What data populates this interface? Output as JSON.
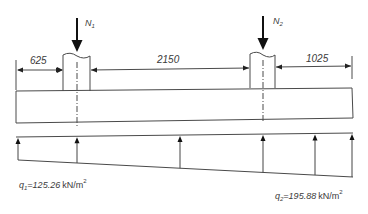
{
  "diagram": {
    "type": "foundation-beam-load-diagram",
    "column_loads": [
      {
        "symbol": "N",
        "subscript": "1"
      },
      {
        "symbol": "N",
        "subscript": "2"
      }
    ],
    "dimensions": [
      {
        "label": "625"
      },
      {
        "label": "2150"
      },
      {
        "label": "1025"
      }
    ],
    "soil_pressure": {
      "left": {
        "symbol": "q",
        "subscript": "1",
        "value": "=125.26",
        "unit": "kN/m",
        "unit_exp": "2"
      },
      "right": {
        "symbol": "q",
        "subscript": "2",
        "value": "=195.88",
        "unit": "kN/m",
        "unit_exp": "2"
      }
    },
    "pressure_arrow_count": 6
  }
}
